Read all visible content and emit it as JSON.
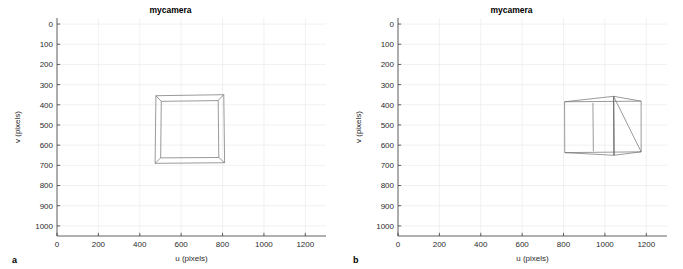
{
  "figure": {
    "background": "#ffffff",
    "axis_color": "#3a3a3a",
    "grid_color": "#ebebeb",
    "object_color": "#6e6e6e"
  },
  "panels": [
    {
      "letter": "a",
      "title": "mycamera",
      "xlabel": "u (pixels)",
      "ylabel": "v (pixels)"
    },
    {
      "letter": "b",
      "title": "mycamera",
      "xlabel": "u (pixels)",
      "ylabel": "v (pixels)"
    }
  ],
  "chart_data": [
    {
      "type": "line",
      "title": "mycamera",
      "xlabel": "u (pixels)",
      "ylabel": "v (pixels)",
      "xlim": [
        0,
        1300
      ],
      "ylim": [
        1050,
        -30
      ],
      "y_inverted": true,
      "grid": true,
      "legend": "none",
      "xticks": [
        0,
        200,
        400,
        600,
        800,
        1000,
        1200
      ],
      "xticklabels": [
        "0",
        "200",
        "400",
        "600",
        "800",
        "1000",
        "1200"
      ],
      "yticks": [
        0,
        100,
        200,
        300,
        400,
        500,
        600,
        700,
        800,
        900,
        1000
      ],
      "yticklabels": [
        "0",
        "100",
        "200",
        "300",
        "400",
        "500",
        "600",
        "700",
        "800",
        "900",
        "1000"
      ],
      "series": [
        {
          "name": "cube-wireframe-front-face",
          "comment": "outer square: near face of cube projected almost head-on",
          "points_uv": [
            [
              478,
              355
            ],
            [
              806,
              350
            ],
            [
              810,
              687
            ],
            [
              474,
              690
            ],
            [
              478,
              355
            ]
          ]
        },
        {
          "name": "cube-wireframe-back-face",
          "comment": "inner square: far face of cube, smaller due to perspective",
          "points_uv": [
            [
              504,
              383
            ],
            [
              779,
              379
            ],
            [
              782,
              661
            ],
            [
              501,
              663
            ],
            [
              504,
              383
            ]
          ]
        },
        {
          "name": "cube-wireframe-edge-topleft",
          "points_uv": [
            [
              478,
              355
            ],
            [
              504,
              383
            ]
          ]
        },
        {
          "name": "cube-wireframe-edge-topright",
          "points_uv": [
            [
              806,
              350
            ],
            [
              779,
              379
            ]
          ]
        },
        {
          "name": "cube-wireframe-edge-bottomright",
          "points_uv": [
            [
              810,
              687
            ],
            [
              782,
              661
            ]
          ]
        },
        {
          "name": "cube-wireframe-edge-bottomleft",
          "points_uv": [
            [
              474,
              690
            ],
            [
              501,
              663
            ]
          ]
        }
      ]
    },
    {
      "type": "line",
      "title": "mycamera",
      "xlabel": "u (pixels)",
      "ylabel": "v (pixels)",
      "xlim": [
        0,
        1300
      ],
      "ylim": [
        1050,
        -30
      ],
      "y_inverted": true,
      "grid": true,
      "legend": "none",
      "xticks": [
        0,
        200,
        400,
        600,
        800,
        1000,
        1200
      ],
      "xticklabels": [
        "0",
        "200",
        "400",
        "600",
        "800",
        "1000",
        "1200"
      ],
      "yticks": [
        0,
        100,
        200,
        300,
        400,
        500,
        600,
        700,
        800,
        900,
        1000
      ],
      "yticklabels": [
        "0",
        "100",
        "200",
        "300",
        "400",
        "500",
        "600",
        "700",
        "800",
        "900",
        "1000"
      ],
      "series": [
        {
          "name": "cube-wireframe-left-face",
          "comment": "left (near) face, rectangular, seen edge-on from an oblique angle",
          "points_uv": [
            [
              805,
              385
            ],
            [
              1042,
              358
            ],
            [
              1044,
              650
            ],
            [
              806,
              637
            ],
            [
              805,
              385
            ]
          ]
        },
        {
          "name": "cube-wireframe-right-face",
          "comment": "right (far) face of the cube",
          "points_uv": [
            [
              1175,
              382
            ],
            [
              1175,
              633
            ],
            [
              1042,
              358
            ],
            [
              1044,
              650
            ]
          ]
        },
        {
          "name": "cube-wireframe-edge-top-front",
          "points_uv": [
            [
              805,
              385
            ],
            [
              1175,
              382
            ]
          ]
        },
        {
          "name": "cube-wireframe-edge-top-back",
          "points_uv": [
            [
              1042,
              358
            ],
            [
              1175,
              382
            ]
          ]
        },
        {
          "name": "cube-wireframe-edge-bottom-front",
          "points_uv": [
            [
              806,
              637
            ],
            [
              1175,
              633
            ]
          ]
        },
        {
          "name": "cube-wireframe-edge-bottom-back",
          "points_uv": [
            [
              1044,
              650
            ],
            [
              1175,
              633
            ]
          ]
        },
        {
          "name": "cube-wireframe-interior-vertical-1",
          "points_uv": [
            [
              942,
              391
            ],
            [
              944,
              630
            ]
          ]
        },
        {
          "name": "cube-wireframe-interior-vertical-2",
          "points_uv": [
            [
              1042,
              358
            ],
            [
              1044,
              650
            ]
          ]
        }
      ]
    }
  ]
}
